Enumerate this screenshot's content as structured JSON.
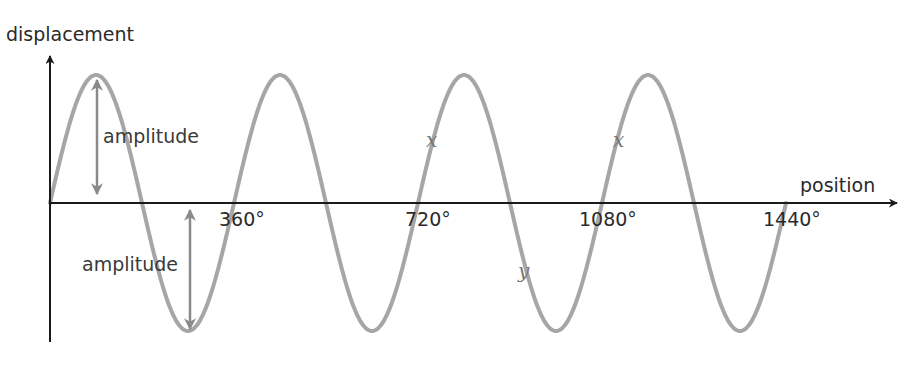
{
  "chart_data": {
    "type": "line",
    "title": "",
    "xlabel": "position",
    "ylabel": "displacement",
    "x_unit": "degrees",
    "x_ticks": [
      360,
      720,
      1080,
      1440
    ],
    "x_tick_labels": [
      "360°",
      "720°",
      "1080°",
      "1440°"
    ],
    "xlim": [
      0,
      1440
    ],
    "ylim": [
      -1,
      1
    ],
    "function": "sine",
    "cycles": 4,
    "amplitude": 1,
    "wavelength_degrees": 360,
    "grid": false,
    "legend": null,
    "series": [
      {
        "name": "wave",
        "x": [
          0,
          90,
          180,
          270,
          360,
          450,
          540,
          630,
          720,
          810,
          900,
          990,
          1080,
          1170,
          1260,
          1350,
          1440
        ],
        "values": [
          0,
          1,
          0,
          -1,
          0,
          1,
          0,
          -1,
          0,
          1,
          0,
          -1,
          0,
          1,
          0,
          -1,
          0
        ]
      }
    ],
    "annotations": [
      {
        "text": "amplitude",
        "type": "double-arrow",
        "from": [
          90,
          0
        ],
        "to": [
          90,
          1
        ]
      },
      {
        "text": "amplitude",
        "type": "double-arrow",
        "from": [
          270,
          0
        ],
        "to": [
          270,
          -1
        ]
      },
      {
        "text": "x",
        "type": "point-label",
        "at_degrees": 720,
        "position": "rising slope above axis"
      },
      {
        "text": "x",
        "type": "point-label",
        "at_degrees": 1080,
        "position": "rising slope above axis"
      },
      {
        "text": "y",
        "type": "point-label",
        "at_degrees": 900,
        "position": "falling slope below axis"
      }
    ]
  },
  "labels": {
    "y_axis": "displacement",
    "x_axis": "position",
    "amplitude_top": "amplitude",
    "amplitude_bottom": "amplitude",
    "tick_360": "360°",
    "tick_720": "720°",
    "tick_1080": "1080°",
    "tick_1440": "1440°",
    "point_x1": "x",
    "point_x2": "x",
    "point_y": "y"
  },
  "colors": {
    "axis": "#1a1a1a",
    "wave": "#a6a6a6",
    "arrow": "#8a8a8a",
    "text": "#2a2a2a"
  }
}
